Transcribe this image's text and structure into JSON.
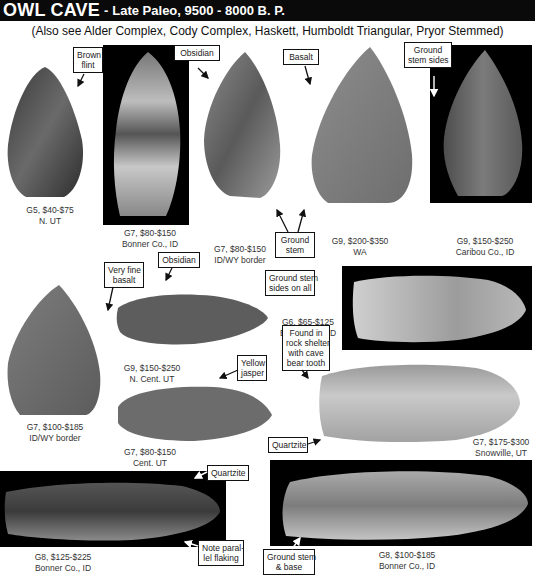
{
  "header": {
    "title": "OWL CAVE",
    "separator": "-",
    "subtitle": "Late Paleo, 9500 - 8000 B. P.",
    "see_also": "(Also see Alder Complex, Cody Complex, Haskett, Humboldt Triangular, Pryor Stemmed)"
  },
  "specimens": [
    {
      "grade_price": "G5, $40-$75",
      "location": "N. UT"
    },
    {
      "grade_price": "G7, $80-$150",
      "location": "Bonner Co., ID"
    },
    {
      "grade_price": "G7, $80-$150",
      "location": "ID/WY border"
    },
    {
      "grade_price": "G9, $200-$350",
      "location": "WA"
    },
    {
      "grade_price": "G9, $150-$250",
      "location": "Caribou Co., ID"
    },
    {
      "grade_price": "G7, $100-$185",
      "location": "ID/WY border"
    },
    {
      "grade_price": "G9, $150-$250",
      "location": "N. Cent. UT"
    },
    {
      "grade_price": "G6, $65-$125",
      "location": "Bonner Co., ID"
    },
    {
      "grade_price": "G7, $80-$150",
      "location": "Cent. UT"
    },
    {
      "grade_price": "G7, $175-$300",
      "location": "Snowville, UT"
    },
    {
      "grade_price": "G8, $125-$225",
      "location": "Bonner Co., ID"
    },
    {
      "grade_price": "G8, $100-$185",
      "location": "Bonner Co., ID"
    }
  ],
  "labels": {
    "brown_flint": [
      "Brown",
      "flint"
    ],
    "obsidian_1": [
      "Obsidian"
    ],
    "basalt": [
      "Basalt"
    ],
    "ground_stem_sides": [
      "Ground",
      "stem sides"
    ],
    "ground_stem": [
      "Ground",
      "stem"
    ],
    "very_fine_basalt": [
      "Very fine",
      "basalt"
    ],
    "obsidian_2": [
      "Obsidian"
    ],
    "ground_stem_sides_all": [
      "Ground stem",
      "sides on all"
    ],
    "yellow_jasper": [
      "Yellow",
      "jasper"
    ],
    "found_in_rock_shelter": [
      "Found in",
      "rock shelter",
      "with cave",
      "bear tooth"
    ],
    "quartzite_1": [
      "Quartzite"
    ],
    "quartzite_2": [
      "Quartzite"
    ],
    "note_parallel_flaking": [
      "Note paral-",
      "lel flaking"
    ],
    "ground_stem_base": [
      "Ground stem",
      "& base"
    ]
  }
}
